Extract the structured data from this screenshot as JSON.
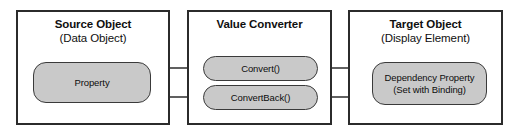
{
  "diagram": {
    "background_color": "#ffffff",
    "border_color": "#2b2b2b",
    "node_fill_color": "#c9c9c9",
    "node_border_color": "#3a3a3a",
    "arrow_color": "#2b2b2b"
  },
  "groups": [
    {
      "id": "source-object",
      "title": "Source Object",
      "subtitle": "(Data Object)"
    },
    {
      "id": "value-converter",
      "title": "Value Converter",
      "subtitle": ""
    },
    {
      "id": "target-object",
      "title": "Target Object",
      "subtitle": "(Display Element)"
    }
  ],
  "nodes": [
    {
      "id": "property",
      "line1": "Property",
      "line2": ""
    },
    {
      "id": "convert",
      "line1": "Convert()",
      "line2": ""
    },
    {
      "id": "convert-back",
      "line1": "ConvertBack()",
      "line2": ""
    },
    {
      "id": "dependency-property",
      "line1": "Dependency Property",
      "line2": "(Set with Binding)"
    }
  ],
  "connectors": [
    {
      "id": "property-to-convert",
      "from": "property",
      "to": "convert",
      "direction": "forward"
    },
    {
      "id": "convert-to-dependency-property",
      "from": "convert",
      "to": "dependency-property",
      "direction": "forward"
    },
    {
      "id": "dependency-property-to-convert-back",
      "from": "dependency-property",
      "to": "convert-back",
      "direction": "forward"
    },
    {
      "id": "convert-back-to-property",
      "from": "convert-back",
      "to": "property",
      "direction": "forward"
    }
  ]
}
